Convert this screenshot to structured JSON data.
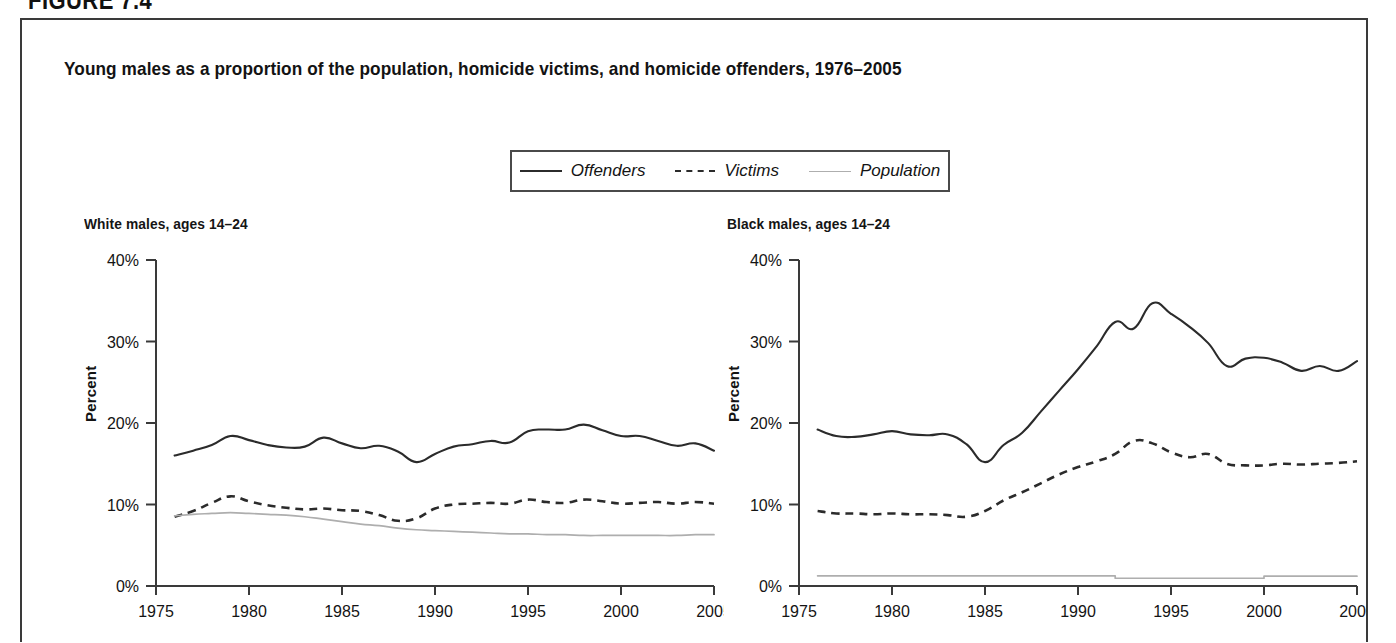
{
  "figure": {
    "header_label": "FIGURE 7.4",
    "title": "Young males as a proportion of the population, homicide victims, and homicide offenders, 1976–2005"
  },
  "legend": {
    "position": "top-center",
    "items": [
      {
        "label": "Offenders",
        "style": "solid",
        "color": "#2b2b2b",
        "icon": "solid-line-icon"
      },
      {
        "label": "Victims",
        "style": "dashed",
        "color": "#2b2b2b",
        "icon": "dashed-line-icon"
      },
      {
        "label": "Population",
        "style": "thin",
        "color": "#aeaeae",
        "icon": "thin-line-icon"
      }
    ]
  },
  "chart_data": [
    {
      "type": "line",
      "title": "White males, ages 14–24",
      "xlabel": "",
      "ylabel": "Percent",
      "xlim": [
        1975,
        2005
      ],
      "ylim": [
        0,
        40
      ],
      "yticks": [
        0,
        10,
        20,
        30,
        40
      ],
      "yticklabels": [
        "0%",
        "10%",
        "20%",
        "30%",
        "40%"
      ],
      "xticks": [
        1975,
        1980,
        1985,
        1990,
        1995,
        2000,
        2005
      ],
      "xticklabels": [
        "1975",
        "1980",
        "1985",
        "1990",
        "1995",
        "2000",
        "2005"
      ],
      "grid": false,
      "x": [
        1976,
        1977,
        1978,
        1979,
        1980,
        1981,
        1982,
        1983,
        1984,
        1985,
        1986,
        1987,
        1988,
        1989,
        1990,
        1991,
        1992,
        1993,
        1994,
        1995,
        1996,
        1997,
        1998,
        1999,
        2000,
        2001,
        2002,
        2003,
        2004,
        2005
      ],
      "series": [
        {
          "name": "Offenders",
          "style": "solid",
          "color": "#2b2b2b",
          "values": [
            16.0,
            16.6,
            17.3,
            18.4,
            17.9,
            17.3,
            17.0,
            17.1,
            18.2,
            17.5,
            16.9,
            17.2,
            16.5,
            15.2,
            16.2,
            17.1,
            17.4,
            17.8,
            17.6,
            19.0,
            19.2,
            19.2,
            19.8,
            19.1,
            18.4,
            18.4,
            17.8,
            17.2,
            17.5,
            16.6
          ]
        },
        {
          "name": "Victims",
          "style": "dashed",
          "color": "#2b2b2b",
          "values": [
            8.5,
            9.2,
            10.2,
            11.0,
            10.4,
            9.9,
            9.6,
            9.4,
            9.5,
            9.3,
            9.2,
            8.7,
            8.0,
            8.3,
            9.5,
            10.0,
            10.1,
            10.2,
            10.1,
            10.6,
            10.3,
            10.2,
            10.6,
            10.4,
            10.1,
            10.2,
            10.3,
            10.1,
            10.3,
            10.1
          ]
        },
        {
          "name": "Population",
          "style": "thin",
          "color": "#aeaeae",
          "values": [
            8.6,
            8.8,
            8.9,
            9.0,
            8.9,
            8.8,
            8.7,
            8.5,
            8.2,
            7.9,
            7.6,
            7.4,
            7.1,
            6.9,
            6.8,
            6.7,
            6.6,
            6.5,
            6.4,
            6.4,
            6.3,
            6.3,
            6.2,
            6.2,
            6.2,
            6.2,
            6.2,
            6.2,
            6.3,
            6.3
          ]
        }
      ]
    },
    {
      "type": "line",
      "title": "Black males, ages 14–24",
      "xlabel": "",
      "ylabel": "Percent",
      "xlim": [
        1975,
        2005
      ],
      "ylim": [
        0,
        40
      ],
      "yticks": [
        0,
        10,
        20,
        30,
        40
      ],
      "yticklabels": [
        "0%",
        "10%",
        "20%",
        "30%",
        "40%"
      ],
      "xticks": [
        1975,
        1980,
        1985,
        1990,
        1995,
        2000,
        2005
      ],
      "xticklabels": [
        "1975",
        "1980",
        "1985",
        "1990",
        "1995",
        "2000",
        "2005"
      ],
      "grid": false,
      "x": [
        1976,
        1977,
        1978,
        1979,
        1980,
        1981,
        1982,
        1983,
        1984,
        1985,
        1986,
        1987,
        1988,
        1989,
        1990,
        1991,
        1992,
        1993,
        1994,
        1995,
        1996,
        1997,
        1998,
        1999,
        2000,
        2001,
        2002,
        2003,
        2004,
        2005
      ],
      "series": [
        {
          "name": "Offenders",
          "style": "solid",
          "color": "#2b2b2b",
          "values": [
            19.2,
            18.4,
            18.3,
            18.6,
            19.0,
            18.6,
            18.5,
            18.6,
            17.4,
            15.2,
            17.3,
            18.8,
            21.4,
            24.0,
            26.6,
            29.4,
            32.4,
            31.6,
            34.7,
            33.4,
            31.8,
            29.8,
            27.0,
            27.9,
            28.0,
            27.4,
            26.4,
            27.0,
            26.4,
            27.6
          ]
        },
        {
          "name": "Victims",
          "style": "dashed",
          "color": "#2b2b2b",
          "values": [
            9.2,
            8.9,
            8.9,
            8.8,
            8.9,
            8.8,
            8.8,
            8.7,
            8.5,
            9.2,
            10.5,
            11.5,
            12.6,
            13.7,
            14.6,
            15.3,
            16.2,
            17.8,
            17.5,
            16.4,
            15.8,
            16.2,
            15.0,
            14.8,
            14.8,
            15.0,
            14.9,
            15.0,
            15.1,
            15.3
          ]
        },
        {
          "name": "Population",
          "style": "thin",
          "color": "#aeaeae",
          "values": [
            1.25,
            1.25,
            1.25,
            1.25,
            1.25,
            1.25,
            1.25,
            1.25,
            1.25,
            1.25,
            1.25,
            1.25,
            1.25,
            1.25,
            1.25,
            1.25,
            0.95,
            0.95,
            0.95,
            0.95,
            0.95,
            0.95,
            0.95,
            0.95,
            1.2,
            1.2,
            1.2,
            1.2,
            1.2,
            1.2
          ]
        }
      ]
    }
  ]
}
